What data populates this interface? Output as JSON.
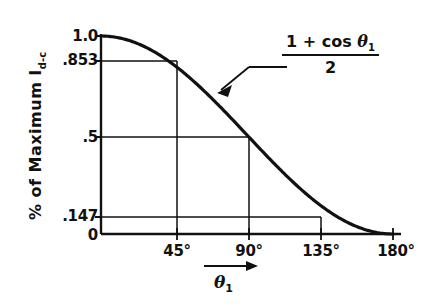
{
  "chart_data": {
    "type": "line",
    "title": "",
    "subtitle": "",
    "xlabel": "θ₁",
    "ylabel": "% of Maximum I d-c",
    "ylabel_main": "% of Maximum I",
    "ylabel_sub": "d-c",
    "xlim": [
      0,
      180
    ],
    "ylim": [
      0,
      1.0
    ],
    "grid": false,
    "legend_position": "none",
    "x": [
      0,
      15,
      30,
      45,
      60,
      75,
      90,
      105,
      120,
      135,
      150,
      165,
      180
    ],
    "y": [
      1.0,
      0.983,
      0.933,
      0.853,
      0.75,
      0.629,
      0.5,
      0.371,
      0.25,
      0.147,
      0.067,
      0.017,
      0.0
    ],
    "series": [
      {
        "name": "(1 + cos θ₁) / 2",
        "values": [
          1.0,
          0.983,
          0.933,
          0.853,
          0.75,
          0.629,
          0.5,
          0.371,
          0.25,
          0.147,
          0.067,
          0.017,
          0.0
        ]
      }
    ],
    "y_ticks": [
      {
        "label": "1.0",
        "value": 1.0
      },
      {
        "label": ".853",
        "value": 0.853
      },
      {
        "label": ".5",
        "value": 0.5
      },
      {
        "label": ".147",
        "value": 0.147
      },
      {
        "label": "0",
        "value": 0
      }
    ],
    "x_ticks": [
      {
        "label": "45°",
        "value": 45
      },
      {
        "label": "90°",
        "value": 90
      },
      {
        "label": "135°",
        "value": 135
      },
      {
        "label": "180°",
        "value": 180
      }
    ],
    "reference_lines": [
      {
        "x": 45,
        "y": 0.853
      },
      {
        "x": 90,
        "y": 0.5
      },
      {
        "x": 135,
        "y": 0.147
      }
    ],
    "annotations": [
      {
        "text": "(1 + cos θ₁) / 2",
        "numerator": "1 + cos θ₁",
        "denominator": "2",
        "points_to_x": 67,
        "points_to_y": 0.69
      }
    ],
    "colors": {
      "background": "#ffffff",
      "curve": "#111111",
      "axis": "#111111",
      "reference_line": "#111111",
      "text": "#111111"
    }
  },
  "formula": {
    "numerator_lead": "1 + cos ",
    "numerator_theta": "θ",
    "numerator_theta_sub": "1",
    "denominator": "2"
  },
  "axis_labels": {
    "y_main": "% of Maximum I",
    "y_sub": "d-c",
    "x_theta": "θ",
    "x_theta_sub": "1"
  },
  "y_tick_labels": [
    ".853",
    "1.0",
    ".5",
    ".147",
    "0"
  ],
  "yticks": {
    "t1": "1.0",
    "t2": ".853",
    "t3": ".5",
    "t4": ".147",
    "t5": "0"
  },
  "xticks": {
    "t1": "45°",
    "t2": "90°",
    "t3": "135°",
    "t4": "180°"
  }
}
